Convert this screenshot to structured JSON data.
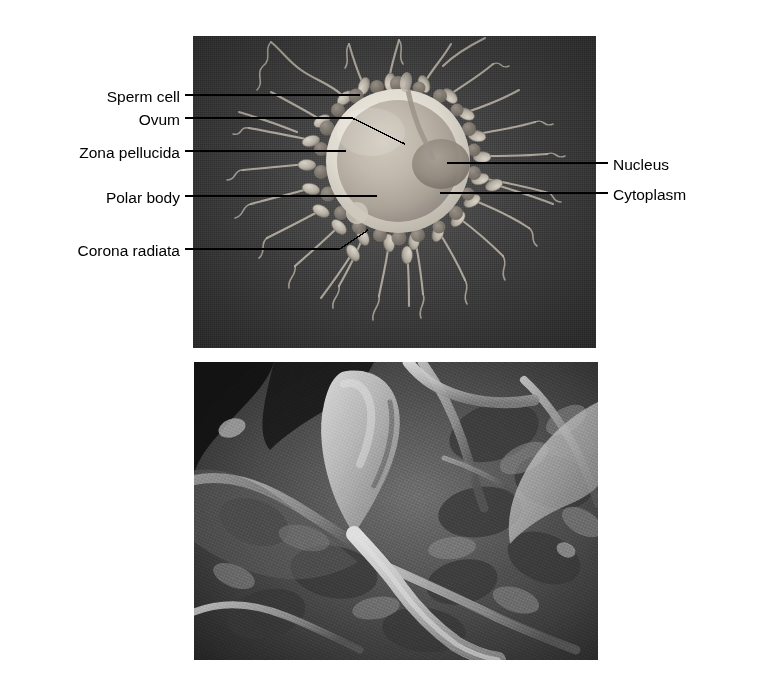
{
  "figure": {
    "background_color": "#ffffff",
    "panel_background_color": "#3c3c3c"
  },
  "labels_left": [
    {
      "id": "sperm-cell",
      "text": "Sperm cell",
      "x": 180,
      "y": 99,
      "leader": {
        "type": "straight",
        "x1": 185,
        "y1": 95,
        "x2": 360,
        "y2": 95
      }
    },
    {
      "id": "ovum",
      "text": "Ovum",
      "x": 180,
      "y": 122,
      "leader": {
        "type": "elbow",
        "x1": 185,
        "y1": 118,
        "x2": 352,
        "y2": 118,
        "x3": 405,
        "y3": 144
      }
    },
    {
      "id": "zona-pellucida",
      "text": "Zona pellucida",
      "x": 180,
      "y": 155,
      "leader": {
        "type": "straight",
        "x1": 185,
        "y1": 151,
        "x2": 346,
        "y2": 151
      }
    },
    {
      "id": "polar-body",
      "text": "Polar body",
      "x": 180,
      "y": 200,
      "leader": {
        "type": "straight",
        "x1": 185,
        "y1": 196,
        "x2": 377,
        "y2": 196
      }
    },
    {
      "id": "corona-radiata",
      "text": "Corona radiata",
      "x": 180,
      "y": 253,
      "leader": {
        "type": "elbow",
        "x1": 185,
        "y1": 249,
        "x2": 340,
        "y2": 249,
        "x3": 368,
        "y3": 230
      }
    }
  ],
  "labels_right": [
    {
      "id": "nucleus",
      "text": "Nucleus",
      "x": 613,
      "y": 167,
      "leader": {
        "type": "straight",
        "x1": 447,
        "y1": 163,
        "x2": 608,
        "y2": 163
      }
    },
    {
      "id": "cytoplasm",
      "text": "Cytoplasm",
      "x": 613,
      "y": 197,
      "leader": {
        "type": "straight",
        "x1": 440,
        "y1": 193,
        "x2": 608,
        "y2": 193
      }
    }
  ],
  "illustration": {
    "name": "ovum-surrounded-by-sperm-illustration",
    "panel": {
      "x": 193,
      "y": 36,
      "width": 403,
      "height": 312
    },
    "ovum": {
      "center_x": 205,
      "center_y": 125,
      "zona_outer_radius": 72,
      "zona_inner_radius": 62,
      "zona_color": "#d9d4c9",
      "cytoplasm_color": "#b9b2a6",
      "nucleus": {
        "cx": 248,
        "cy": 127,
        "rx": 29,
        "ry": 25,
        "color": "#8e867b"
      },
      "polar_body": {
        "cx": 165,
        "cy": 176,
        "r": 11,
        "color": "#cdc6ba"
      }
    },
    "sperm_count": 26,
    "sperm_head_color": "#c9c3b7",
    "sperm_tail_color": "#b0a99e",
    "corona_radiata_granule_count": 22,
    "corona_radiata_color": "#8a837a"
  },
  "micrograph": {
    "name": "sperm-on-ovum-surface-sem",
    "type": "scanning-electron-micrograph",
    "panel": {
      "x": 194,
      "y": 362,
      "width": 404,
      "height": 298
    },
    "description": "Scanning electron micrograph of a sperm cell with a pear-shaped head and long tail lying on the textured surface of an ovum",
    "dark_tone": "#1e1e1e",
    "mid_tone": "#6e6e6e",
    "light_tone": "#d8d8d8"
  }
}
